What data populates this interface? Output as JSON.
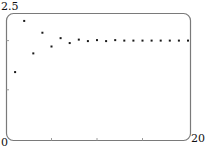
{
  "chart_data": {
    "type": "scatter",
    "title": "",
    "xlabel": "",
    "ylabel": "",
    "xlim": [
      0,
      20
    ],
    "ylim": [
      0,
      2.5
    ],
    "grid": false,
    "legend": null,
    "axis_labels": {
      "y_max": "2.5",
      "origin": "0",
      "x_max": "20"
    },
    "x_ticks": [
      5,
      10,
      15
    ],
    "y_ticks": [
      1,
      2
    ],
    "x": [
      1,
      2,
      3,
      4,
      5,
      6,
      7,
      8,
      9,
      10,
      11,
      12,
      13,
      14,
      15,
      16,
      17,
      18,
      19,
      20
    ],
    "series": [
      {
        "name": "sequence",
        "values": [
          1.36,
          2.4,
          1.74,
          2.16,
          1.88,
          2.05,
          1.95,
          2.02,
          1.99,
          2.01,
          1.99,
          2.01,
          2.0,
          2.0,
          2.0,
          2.0,
          2.0,
          2.0,
          2.0,
          2.0
        ]
      }
    ]
  },
  "colors": {
    "frame": "#7a7a7a",
    "point": "#1a1a1a",
    "tick": "#9a9a9a"
  }
}
